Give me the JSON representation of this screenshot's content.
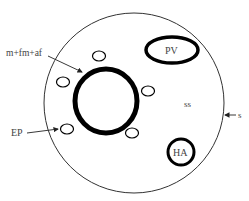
{
  "diagram": {
    "labels": {
      "inner_boundary": "m+fm+af",
      "vesicle": "PV",
      "matrix": "ss",
      "outer_boundary": "s",
      "small_body": "EP",
      "granule": "HA"
    },
    "colors": {
      "stroke": "#000000",
      "thin_stroke": "#333333",
      "text": "#444444",
      "background": "#ffffff"
    }
  }
}
